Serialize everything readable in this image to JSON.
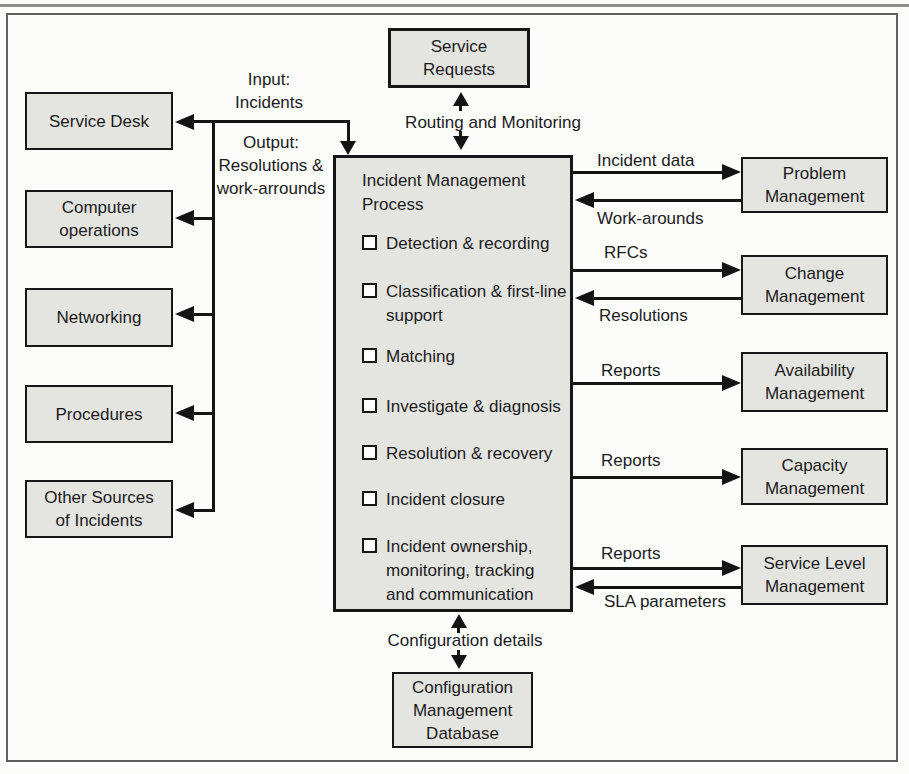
{
  "colors": {
    "box_fill": "#e4e4e1",
    "box_border": "#161616",
    "arrow": "#141414",
    "text": "#1b1b1b",
    "frame_border": "#5f5f5f",
    "background": "#fcfcfb"
  },
  "boxes": {
    "service_requests": [
      "Service",
      "Requests"
    ],
    "service_desk": [
      "Service Desk"
    ],
    "computer_operations": [
      "Computer",
      "operations"
    ],
    "networking": [
      "Networking"
    ],
    "procedures": [
      "Procedures"
    ],
    "other_sources": [
      "Other Sources",
      "of Incidents"
    ],
    "problem_management": [
      "Problem",
      "Management"
    ],
    "change_management": [
      "Change",
      "Management"
    ],
    "availability_management": [
      "Availability",
      "Management"
    ],
    "capacity_management": [
      "Capacity",
      "Management"
    ],
    "service_level_management": [
      "Service Level",
      "Management"
    ],
    "configuration_management_database": [
      "Configuration",
      "Management",
      "Database"
    ]
  },
  "process": {
    "title": [
      "Incident Management",
      "Process"
    ],
    "items": [
      [
        "Detection & recording"
      ],
      [
        "Classification & first-line",
        "support"
      ],
      [
        "Matching"
      ],
      [
        "Investigate & diagnosis"
      ],
      [
        "Resolution & recovery"
      ],
      [
        "Incident closure"
      ],
      [
        "Incident ownership,",
        "monitoring, tracking",
        "and communication"
      ]
    ]
  },
  "labels": {
    "input": [
      "Input:",
      "Incidents"
    ],
    "output": [
      "Output:",
      "Resolutions &",
      "work-arrounds"
    ],
    "routing_and_monitoring": "Routing and Monitoring",
    "incident_data": "Incident data",
    "work_arounds": "Work-arounds",
    "rfcs": "RFCs",
    "resolutions": "Resolutions",
    "reports_availability": "Reports",
    "reports_capacity": "Reports",
    "reports_service_level": "Reports",
    "sla_parameters": "SLA parameters",
    "configuration_details": "Configuration details"
  }
}
